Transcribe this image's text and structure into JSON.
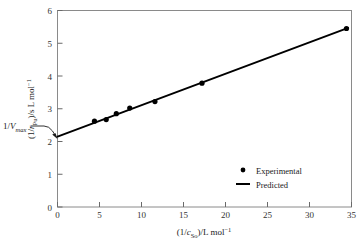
{
  "chart_data": {
    "type": "scatter",
    "title": "",
    "subtitle": "",
    "xlabel_plain": "(1/cSo)/L mol-1",
    "ylabel_plain": "(1/rPu)/s L mol-1",
    "xlabel_parts": {
      "open": "(1/",
      "var": "c",
      "subscript": "So",
      "close": ")/L mol",
      "exponent": "−1"
    },
    "ylabel_parts": {
      "open": "(1/",
      "var": "r",
      "subscript": "Pu",
      "close": ")/s L mol",
      "exponent": "−1"
    },
    "xlim": [
      0,
      35
    ],
    "ylim": [
      0,
      6
    ],
    "xticks": [
      0,
      5,
      10,
      15,
      20,
      25,
      30,
      35
    ],
    "yticks": [
      0,
      1,
      2,
      3,
      4,
      5,
      6
    ],
    "xtick_labels": [
      "0",
      "5",
      "10",
      "15",
      "20",
      "25",
      "30",
      "35"
    ],
    "ytick_labels": [
      "0",
      "1",
      "2",
      "3",
      "4",
      "5",
      "6"
    ],
    "grid": false,
    "frame": true,
    "legend_position": "lower right",
    "series": [
      {
        "name": "Experimental",
        "type": "scatter",
        "marker": "filled-circle",
        "color": "#000000",
        "x": [
          4.4,
          5.8,
          7.0,
          8.6,
          11.6,
          17.2,
          34.4
        ],
        "y": [
          2.62,
          2.67,
          2.85,
          3.02,
          3.22,
          3.78,
          5.45
        ]
      },
      {
        "name": "Predicted",
        "type": "line",
        "color": "#000000",
        "x": [
          0,
          34.6
        ],
        "y": [
          2.15,
          5.47
        ],
        "intercept": 2.15,
        "slope": 0.096
      }
    ],
    "annotations": [
      {
        "name": "y-intercept-annotation",
        "text_parts": {
          "prefix": "1/",
          "var": "V",
          "subscript": "max"
        },
        "text_plain": "1/Vmax",
        "points_to_x": 0,
        "points_to_y": 2.15
      }
    ]
  },
  "legend": {
    "items": [
      {
        "label": "Experimental",
        "marker": "filled-circle"
      },
      {
        "label": "Predicted",
        "marker": "solid-line"
      }
    ]
  },
  "colors": {
    "ink": "#000000",
    "axis": "#4d4d4d",
    "background": "#ffffff"
  }
}
